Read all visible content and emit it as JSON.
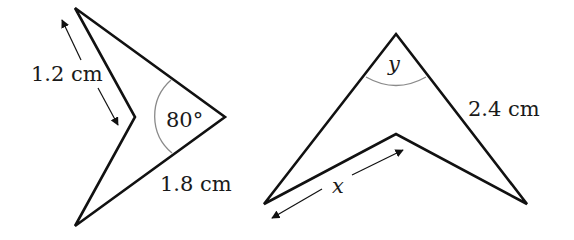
{
  "figure_left": {
    "shape": "kite-like concave quadrilateral (dart)",
    "vertices": [
      [
        75,
        8
      ],
      [
        225,
        117
      ],
      [
        75,
        226
      ],
      [
        135,
        117
      ]
    ],
    "side_label": "1.2 cm",
    "bottom_label": "1.8 cm",
    "angle_label": "80°"
  },
  "figure_right": {
    "shape": "arrowhead concave quadrilateral",
    "vertices": [
      [
        396,
        34
      ],
      [
        527,
        204
      ],
      [
        396,
        134
      ],
      [
        264,
        204
      ]
    ],
    "side_label": "2.4 cm",
    "unknown_side_label": "x",
    "unknown_angle_label": "y"
  },
  "colors": {
    "stroke": "#111111",
    "arc": "#8a8a8a",
    "text": "#1a1a1a",
    "background": "#ffffff"
  }
}
